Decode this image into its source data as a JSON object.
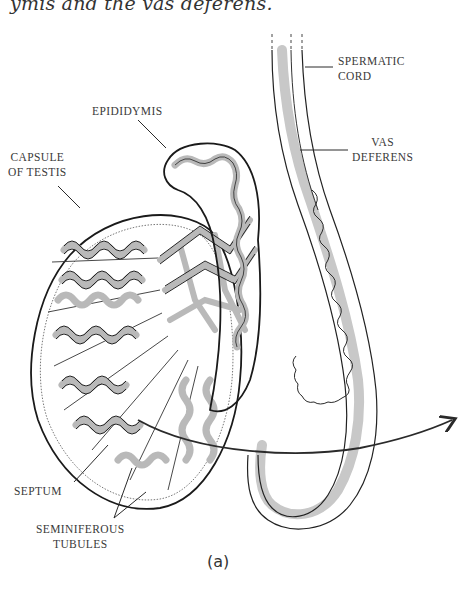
{
  "caption": {
    "top_text": "ymis and the vas deferens."
  },
  "figure": {
    "panel_letter": "(a)",
    "colors": {
      "background": "#ffffff",
      "outline": "#1e1e1e",
      "tubule_fill": "#b9b9b9",
      "cord_shading": "#c8c8c8",
      "label_text": "#3a3a3a"
    },
    "labels": {
      "spermatic_cord": [
        "SPERMATIC",
        "CORD"
      ],
      "epididymis": "EPIDIDYMIS",
      "vas_deferens": [
        "VAS",
        "DEFERENS"
      ],
      "capsule_of_testis": [
        "CAPSULE",
        "OF TESTIS"
      ],
      "septum": "SEPTUM",
      "seminiferous_tubules": [
        "SEMINIFEROUS",
        "TUBULES"
      ]
    }
  }
}
